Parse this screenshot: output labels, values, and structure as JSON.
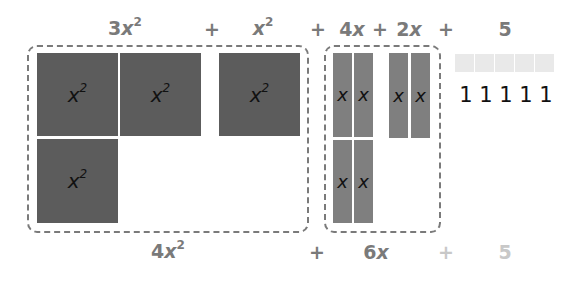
{
  "top_expression": {
    "terms": [
      {
        "coef": "3",
        "var": "x",
        "exp": "2"
      },
      {
        "op": "+"
      },
      {
        "coef": "",
        "var": "x",
        "exp": "2"
      },
      {
        "op": "+"
      },
      {
        "coef": "4",
        "var": "x",
        "exp": ""
      },
      {
        "op": "+"
      },
      {
        "coef": "2",
        "var": "x",
        "exp": ""
      },
      {
        "op": "+"
      },
      {
        "coef": "5",
        "var": "",
        "exp": ""
      }
    ]
  },
  "tiles": {
    "x_squared_label_var": "x",
    "x_squared_label_exp": "2",
    "x_label": "x",
    "unit_label": "1",
    "x_squared_count": 4,
    "x_bar_count": 6,
    "unit_count": 5,
    "units": [
      "1",
      "1",
      "1",
      "1",
      "1"
    ]
  },
  "bottom_expression": {
    "terms": [
      {
        "coef": "4",
        "var": "x",
        "exp": "2"
      },
      {
        "op": "+"
      },
      {
        "coef": "6",
        "var": "x",
        "exp": ""
      },
      {
        "op": "+",
        "faint": true
      },
      {
        "coef": "5",
        "var": "",
        "exp": "",
        "faint": true
      }
    ]
  },
  "colors": {
    "x_squared_tile": "#5c5c5c",
    "x_tile": "#7f7f7f",
    "unit_tile": "#e9e9e9",
    "label": "#7a7a7a",
    "faint_label": "#c8c8c8"
  }
}
